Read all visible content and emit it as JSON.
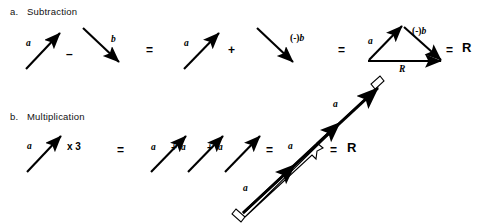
{
  "figure": {
    "background_color": "#ffffff",
    "ink_color": "#000000",
    "width": 482,
    "height": 224
  },
  "sections": [
    {
      "marker": "a.",
      "title": "Subtraction"
    },
    {
      "marker": "b.",
      "title": "Multiplication"
    }
  ],
  "subtraction": {
    "vector_a_label": "a",
    "minus_operator": "–",
    "vector_b_label": "b",
    "equals_operator_1": "=",
    "vector_a_label_2": "a",
    "plus_operator": "+",
    "neg_b_paren": "(-)",
    "neg_b_letter": "b",
    "equals_operator_2": "=",
    "triangle_a_label": "a",
    "triangle_negb_paren": "(-)",
    "triangle_negb_letter": "b",
    "triangle_resultant_label": "R",
    "equals_operator_3": "=",
    "result_label": "R"
  },
  "multiplication": {
    "vector_a_label": "a",
    "times_operator": "x 3",
    "equals_operator_1": "=",
    "sum_terms": [
      "a",
      "a",
      "a"
    ],
    "plus_operator_1": "+",
    "plus_operator_2": "+",
    "equals_operator_2": "=",
    "long_vector_segment_labels": [
      "a",
      "a",
      "a"
    ],
    "equals_operator_3": "=",
    "result_label": "R"
  }
}
